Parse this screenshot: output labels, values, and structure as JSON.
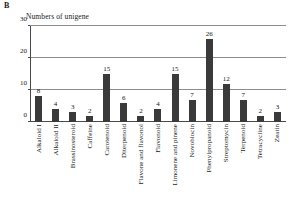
{
  "panel": {
    "label": "B"
  },
  "chart_data": {
    "type": "bar",
    "title": "Numbers of unigene",
    "xlabel": "",
    "ylabel": "Numbers of unigene",
    "ylim": [
      0,
      30
    ],
    "yticks": [
      0,
      10,
      20,
      30
    ],
    "grid": true,
    "legend": false,
    "bar_color": "#3a3a3a",
    "show_value_labels": true,
    "categories": [
      "Alkaloid I",
      "Alkaloid II",
      "Brassinosteroid",
      "Caffeine",
      "Carotenoid",
      "Diterpenoid",
      "Flavone and flavonol",
      "Flavonoid",
      "Limonene and pinene",
      "Novobiocin",
      "Phenylpropanoid",
      "Streptomycin",
      "Terpenoid",
      "Tetracycline",
      "Zeatin"
    ],
    "values": [
      8,
      4,
      3,
      2,
      15,
      6,
      2,
      4,
      15,
      7,
      26,
      12,
      7,
      2,
      3
    ]
  }
}
